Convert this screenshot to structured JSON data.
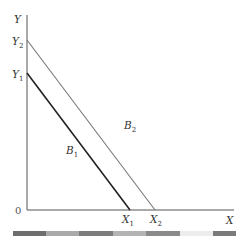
{
  "diagram": {
    "axes": {
      "y_label": "Y",
      "x_label": "X",
      "origin_label": "0"
    },
    "y_intercepts": [
      {
        "base": "Y",
        "sub": "2"
      },
      {
        "base": "Y",
        "sub": "1"
      }
    ],
    "x_intercepts": [
      {
        "base": "X",
        "sub": "1"
      },
      {
        "base": "X",
        "sub": "2"
      }
    ],
    "lines": [
      {
        "base": "B",
        "sub": "1",
        "color": "#222222"
      },
      {
        "base": "B",
        "sub": "2",
        "color": "#777777"
      }
    ]
  },
  "bottom_bar": {
    "segments": [
      {
        "color": "#6e6e6e"
      },
      {
        "color": "#a9a9a9"
      },
      {
        "color": "#7c7c7c"
      },
      {
        "color": "#b3b3b3"
      },
      {
        "color": "#8a8a8a"
      },
      {
        "color": "#ececec"
      },
      {
        "color": "#7a7a7a"
      }
    ]
  }
}
